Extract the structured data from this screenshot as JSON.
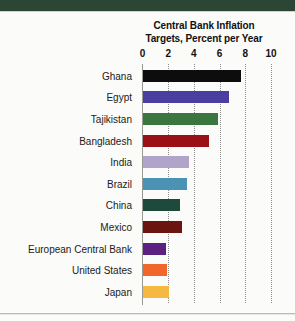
{
  "page": {
    "top_band_color": "#2b4634",
    "background_color": "#fbfbf9"
  },
  "chart_data": {
    "type": "bar",
    "orientation": "horizontal",
    "title": "Central Bank Inflation Targets, Percent per Year",
    "title_line1": "Central Bank Inflation",
    "title_line2": "Targets, Percent per Year",
    "xlabel": "",
    "ylabel": "",
    "xlim": [
      0,
      10
    ],
    "tick_labels": [
      "0",
      "2",
      "4",
      "6",
      "8",
      "10"
    ],
    "tick_values": [
      0,
      2,
      4,
      6,
      8,
      10
    ],
    "grid": "vertical dotted gridlines at each tick",
    "legend": "none",
    "categories": [
      "Ghana",
      "Egypt",
      "Tajikistan",
      "Bangladesh",
      "India",
      "Brazil",
      "China",
      "Mexico",
      "European Central Bank",
      "United States",
      "Japan"
    ],
    "values": [
      7.6,
      6.7,
      5.8,
      5.1,
      3.6,
      3.4,
      2.9,
      3.0,
      1.8,
      1.9,
      2.0
    ],
    "colors": [
      "#0d0d0d",
      "#4a3fa0",
      "#3a7640",
      "#9b0f17",
      "#b0a5c8",
      "#4a93b5",
      "#1d4a3c",
      "#6b1410",
      "#5b2080",
      "#f1662a",
      "#f5b942"
    ],
    "bars": [
      {
        "label": "Ghana",
        "value": 7.6,
        "color": "#0d0d0d"
      },
      {
        "label": "Egypt",
        "value": 6.7,
        "color": "#4a3fa0"
      },
      {
        "label": "Tajikistan",
        "value": 5.8,
        "color": "#3a7640"
      },
      {
        "label": "Bangladesh",
        "value": 5.1,
        "color": "#9b0f17"
      },
      {
        "label": "India",
        "value": 3.6,
        "color": "#b0a5c8"
      },
      {
        "label": "Brazil",
        "value": 3.4,
        "color": "#4a93b5"
      },
      {
        "label": "China",
        "value": 2.9,
        "color": "#1d4a3c"
      },
      {
        "label": "Mexico",
        "value": 3.0,
        "color": "#6b1410"
      },
      {
        "label": "European Central Bank",
        "value": 1.8,
        "color": "#5b2080"
      },
      {
        "label": "United States",
        "value": 1.9,
        "color": "#f1662a"
      },
      {
        "label": "Japan",
        "value": 2.0,
        "color": "#f5b942"
      }
    ]
  }
}
